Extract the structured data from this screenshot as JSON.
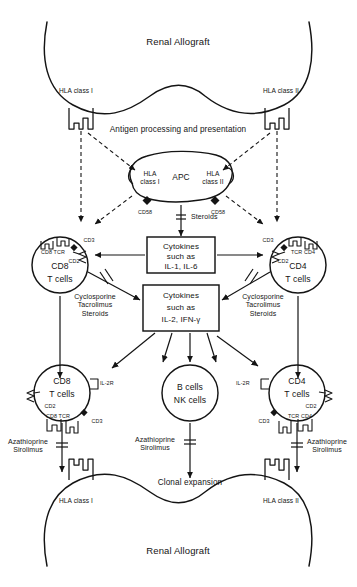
{
  "figure": {
    "type": "diagram",
    "background_color": "#ffffff",
    "line_color": "#141414",
    "text_color": "#141414"
  },
  "graft": {
    "top_title": "Renal Allograft",
    "bottom_title": "Renal Allograft",
    "top_hla_left": "HLA class I",
    "top_hla_right": "HLA class II",
    "bottom_hla_left": "HLA class I",
    "bottom_hla_right": "HLA class II"
  },
  "antigen_presentation": {
    "caption": "Antigen processing and presentation"
  },
  "apc": {
    "name": "APC",
    "hla_class_i": "HLA\nclass I",
    "hla_class_ii": "HLA\nclass II",
    "cd58_left": "CD58",
    "cd58_right": "CD58"
  },
  "inhibitors": {
    "apc_to_cytokine": "Steroids",
    "left_t_cell": "Cyclosporine\nTacrolimus\nSteroids",
    "right_t_cell": "Cyclosporine\nTacrolimus\nSteroids",
    "proliferation_left": "Azathioprine\nSirolimus",
    "proliferation_center": "Azathioprine\nSirolimus",
    "proliferation_right": "Azathioprine\nSirolimus"
  },
  "cytokine_boxes": [
    {
      "id": "cytokines-il1-il6",
      "line1": "Cytokines",
      "line2": "such as",
      "line3": "IL-1, IL-6"
    },
    {
      "id": "cytokines-il2-ifng",
      "line1": "Cytokines",
      "line2": "such as",
      "line3": "IL-2, IFN-γ"
    }
  ],
  "cells": {
    "upper_left": {
      "id": "cd8-t-cell-upper",
      "line1": "CD8",
      "line2": "T cells",
      "markers": [
        "CD3",
        "CD8 TCR",
        "CD2"
      ]
    },
    "upper_right": {
      "id": "cd4-t-cell-upper",
      "line1": "CD4",
      "line2": "T cells",
      "markers": [
        "CD3",
        "TCR CD4",
        "CD2"
      ]
    },
    "lower_left": {
      "id": "cd8-t-cell-lower",
      "line1": "CD8",
      "line2": "T cells",
      "markers": [
        "IL-2R",
        "CD2",
        "CD8 TCR",
        "CD3"
      ]
    },
    "lower_center": {
      "id": "b-nk-cells",
      "line1": "B cells",
      "line2": "NK cells",
      "markers": []
    },
    "lower_right": {
      "id": "cd4-t-cell-lower",
      "line1": "CD4",
      "line2": "T cells",
      "markers": [
        "IL-2R",
        "CD2",
        "TCR CD4",
        "CD3"
      ]
    }
  },
  "expansion": {
    "caption": "Clonal expansion"
  }
}
